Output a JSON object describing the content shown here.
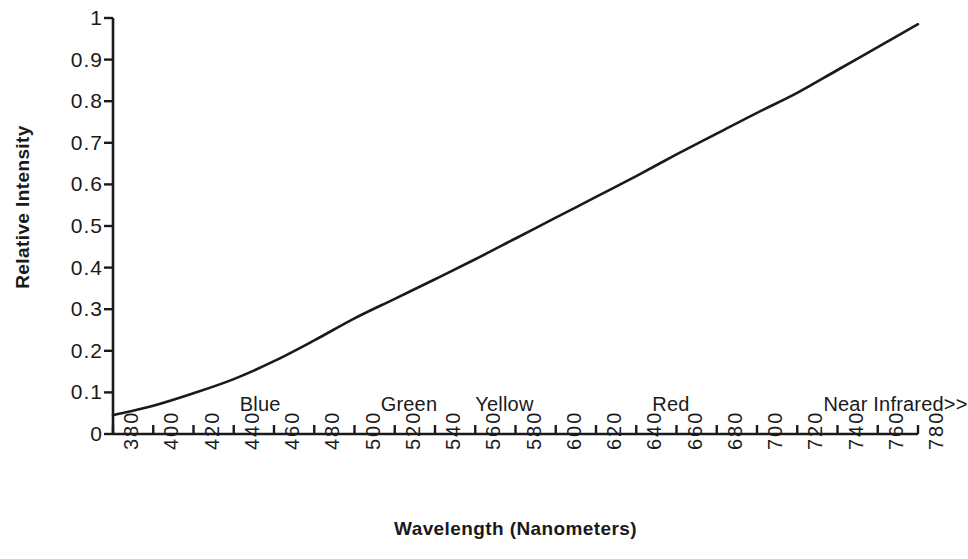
{
  "chart_data": {
    "type": "line",
    "title": "",
    "xlabel": "Wavelength (Nanometers)",
    "ylabel": "Relative Intensity",
    "xlim": [
      380,
      780
    ],
    "ylim": [
      0,
      1
    ],
    "grid": false,
    "legend": "none",
    "xticks": [
      380,
      400,
      420,
      440,
      460,
      480,
      500,
      520,
      540,
      560,
      580,
      600,
      620,
      640,
      660,
      680,
      700,
      720,
      740,
      760,
      780
    ],
    "xtick_labels": [
      "380",
      "400",
      "420",
      "440",
      "460",
      "480",
      "500",
      "520",
      "540",
      "560",
      "580",
      "600",
      "620",
      "640",
      "660",
      "680",
      "700",
      "720",
      "740",
      "760",
      "780"
    ],
    "yticks": [
      0,
      0.1,
      0.2,
      0.3,
      0.4,
      0.5,
      0.6,
      0.7,
      0.8,
      0.9,
      1
    ],
    "ytick_labels": [
      "0",
      "0.1",
      "0.2",
      "0.3",
      "0.4",
      "0.5",
      "0.6",
      "0.7",
      "0.8",
      "0.9",
      "1"
    ],
    "series": [
      {
        "name": "Relative Intensity",
        "color": "#1a1a1a",
        "x": [
          380,
          400,
          420,
          440,
          460,
          480,
          500,
          520,
          540,
          560,
          580,
          600,
          620,
          640,
          660,
          680,
          700,
          720,
          740,
          760,
          780
        ],
        "y": [
          0.045,
          0.068,
          0.098,
          0.132,
          0.175,
          0.225,
          0.278,
          0.325,
          0.372,
          0.42,
          0.47,
          0.52,
          0.57,
          0.62,
          0.672,
          0.722,
          0.772,
          0.82,
          0.875,
          0.93,
          0.985
        ]
      }
    ],
    "annotations": [
      {
        "text": "Blue",
        "x": 443,
        "y": 0.048
      },
      {
        "text": "Green",
        "x": 513,
        "y": 0.048
      },
      {
        "text": "Yellow",
        "x": 560,
        "y": 0.048
      },
      {
        "text": "Red",
        "x": 648,
        "y": 0.048
      },
      {
        "text": "Near Infrared>>",
        "x": 733,
        "y": 0.048
      }
    ],
    "axis_color": "#1a1a1a"
  }
}
